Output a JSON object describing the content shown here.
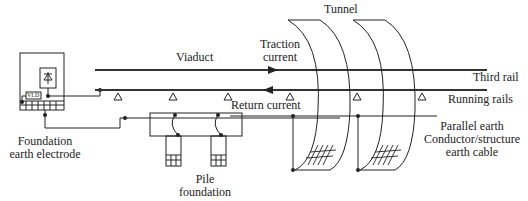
{
  "labels": {
    "tunnel": "Tunnel",
    "traction_current_line1": "Traction",
    "traction_current_line2": "current",
    "viaduct": "Viaduct",
    "third_rail": "Third rail",
    "running_rails": "Running rails",
    "return_current": "Return current",
    "parallel_earth_line1": "Parallel earth",
    "parallel_earth_line2": "Conductor/structure",
    "parallel_earth_line3": "earth cable",
    "foundation_line1": "Foundation",
    "foundation_line2": "earth electrode",
    "pile_line1": "Pile",
    "pile_line2": "foundation",
    "vld": "VLD"
  },
  "colors": {
    "line": "#222222",
    "rail": "#333333",
    "background": "#ffffff"
  }
}
